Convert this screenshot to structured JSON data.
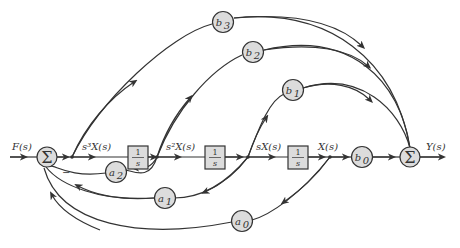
{
  "diagram": {
    "type": "signal-flow block diagram (controller canonical form)",
    "input_label": "F(s)",
    "output_label": "Y(s)",
    "summing_junctions": [
      {
        "id": "sum_in",
        "symbol": "Σ"
      },
      {
        "id": "sum_out",
        "symbol": "Σ"
      }
    ],
    "signals": {
      "s3X": "s³X(s)",
      "s2X": "s²X(s)",
      "sX": "sX(s)",
      "X": "X(s)"
    },
    "integrators": [
      {
        "num": "1",
        "den": "s"
      },
      {
        "num": "1",
        "den": "s"
      },
      {
        "num": "1",
        "den": "s"
      }
    ],
    "feedforward_gains": [
      {
        "base": "b",
        "sub": "3"
      },
      {
        "base": "b",
        "sub": "2"
      },
      {
        "base": "b",
        "sub": "1"
      },
      {
        "base": "b",
        "sub": "0"
      }
    ],
    "feedback_gains": [
      {
        "base": "a",
        "sub": "2"
      },
      {
        "base": "a",
        "sub": "1"
      },
      {
        "base": "a",
        "sub": "0"
      }
    ],
    "feedback_sign": "−"
  }
}
